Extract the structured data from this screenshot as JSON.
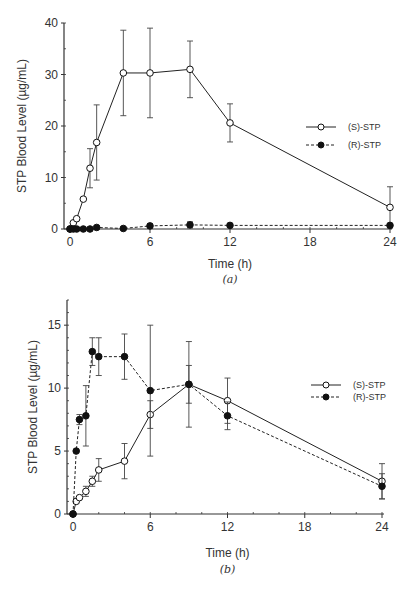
{
  "chart_data": [
    {
      "type": "line",
      "panel": "(a)",
      "title": "",
      "xlabel": "Time (h)",
      "ylabel": "STP Blood Level (µg/mL)",
      "xlim": [
        0,
        24
      ],
      "ylim": [
        0,
        40
      ],
      "xticks": [
        0,
        6,
        12,
        18,
        24
      ],
      "yticks": [
        0,
        10,
        20,
        30,
        40
      ],
      "grid": false,
      "legend_position": "right-middle",
      "series": [
        {
          "name": "(S)-STP",
          "marker": "open-circle",
          "line": "solid",
          "x": [
            0,
            0.25,
            0.5,
            1,
            1.5,
            2,
            4,
            6,
            9,
            12,
            24
          ],
          "values": [
            0,
            1.2,
            2.0,
            5.8,
            11.8,
            16.8,
            30.3,
            30.3,
            31.0,
            20.6,
            4.2
          ],
          "error": [
            0,
            0,
            0,
            0,
            3.8,
            7.3,
            8.3,
            8.7,
            5.5,
            3.7,
            4.0
          ]
        },
        {
          "name": "(R)-STP",
          "marker": "filled-circle",
          "line": "dashed",
          "x": [
            0,
            0.25,
            0.5,
            1,
            1.5,
            2,
            4,
            6,
            9,
            12,
            24
          ],
          "values": [
            0,
            0,
            0,
            0,
            0,
            0.3,
            0.1,
            0.6,
            0.8,
            0.7,
            0.7
          ],
          "error": [
            0,
            0,
            0,
            0,
            0,
            0,
            0,
            0.4,
            0.6,
            0.3,
            0.2
          ]
        }
      ]
    },
    {
      "type": "line",
      "panel": "(b)",
      "title": "",
      "xlabel": "Time (h)",
      "ylabel": "STP Blood Level (µg/mL)",
      "xlim": [
        0,
        24
      ],
      "ylim": [
        0,
        17
      ],
      "xticks": [
        0,
        6,
        12,
        18,
        24
      ],
      "yticks": [
        0,
        5,
        10,
        15
      ],
      "grid": false,
      "legend_position": "right-middle",
      "series": [
        {
          "name": "(S)-STP",
          "marker": "open-circle",
          "line": "solid",
          "x": [
            0,
            0.25,
            0.5,
            1,
            1.5,
            2,
            4,
            6,
            9,
            12,
            24
          ],
          "values": [
            0,
            1.0,
            1.3,
            1.8,
            2.6,
            3.5,
            4.2,
            7.9,
            10.3,
            9.0,
            2.6
          ],
          "error": [
            0,
            0,
            0,
            0.4,
            0.4,
            0.9,
            1.4,
            1.1,
            1.5,
            1.8,
            1.4
          ]
        },
        {
          "name": "(R)-STP",
          "marker": "filled-circle",
          "line": "dashed",
          "x": [
            0,
            0.25,
            0.5,
            1,
            1.5,
            2,
            4,
            6,
            9,
            12,
            24
          ],
          "values": [
            0,
            5.0,
            7.5,
            7.8,
            12.9,
            12.5,
            12.5,
            9.8,
            10.3,
            7.8,
            2.2
          ],
          "error": [
            0,
            0,
            0.4,
            2.4,
            1.1,
            1.5,
            1.8,
            5.2,
            3.4,
            1.1,
            1.0
          ]
        }
      ]
    }
  ]
}
